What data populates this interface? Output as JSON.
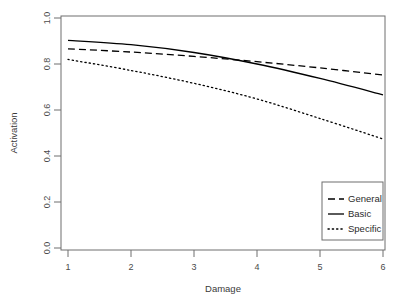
{
  "chart_data": {
    "type": "line",
    "title": "",
    "xlabel": "Damage",
    "ylabel": "Activation",
    "xlim": [
      1,
      6
    ],
    "ylim": [
      0.0,
      1.0
    ],
    "xticks": [
      1,
      2,
      3,
      4,
      5,
      6
    ],
    "xtick_labels": [
      "1",
      "2",
      "3",
      "4",
      "5",
      "6"
    ],
    "yticks": [
      0.0,
      0.2,
      0.4,
      0.6,
      0.8,
      1.0
    ],
    "ytick_labels": [
      "0.0",
      "0.2",
      "0.4",
      "0.6",
      "0.8",
      "1.0"
    ],
    "grid": false,
    "legend_position": "bottom-right",
    "x": [
      1,
      2,
      3,
      4,
      5,
      6
    ],
    "series": [
      {
        "name": "General",
        "linestyle": "dashed",
        "color": "#000000",
        "values": [
          0.866,
          0.852,
          0.833,
          0.81,
          0.783,
          0.752
        ]
      },
      {
        "name": "Basic",
        "linestyle": "solid",
        "color": "#000000",
        "values": [
          0.903,
          0.884,
          0.85,
          0.8,
          0.737,
          0.666
        ]
      },
      {
        "name": "Specific",
        "linestyle": "dotted",
        "color": "#000000",
        "values": [
          0.82,
          0.772,
          0.716,
          0.648,
          0.563,
          0.474
        ]
      }
    ]
  },
  "axes": {
    "x_title": "Damage",
    "y_title": "Activation",
    "x_tick_labels": [
      "1",
      "2",
      "3",
      "4",
      "5",
      "6"
    ],
    "y_tick_labels": [
      "0.0",
      "0.2",
      "0.4",
      "0.6",
      "0.8",
      "1.0"
    ]
  },
  "legend": {
    "items": [
      {
        "label": "General",
        "style": "dashed"
      },
      {
        "label": "Basic",
        "style": "solid"
      },
      {
        "label": "Specific",
        "style": "dotted"
      }
    ]
  },
  "colors": {
    "line": "#000000",
    "frame": "#6e6e6e",
    "text": "#3a3a3a",
    "background": "#ffffff"
  }
}
